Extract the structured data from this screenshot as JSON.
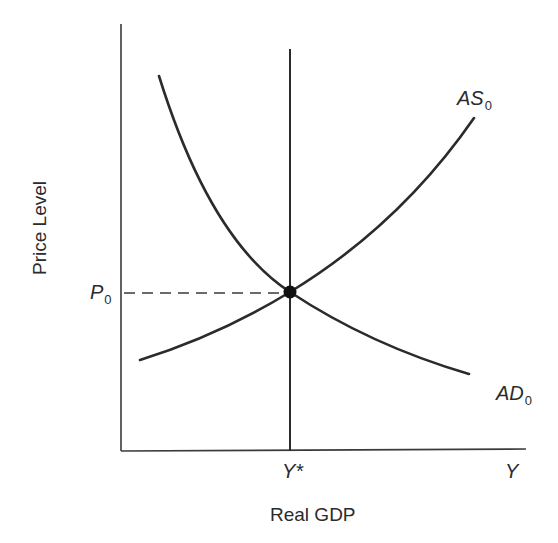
{
  "diagram": {
    "title": "",
    "axes": {
      "y_label": "Price Level",
      "x_label": "Real GDP",
      "x_end_label": "Y"
    },
    "markers": {
      "price_level": {
        "base": "P",
        "sub": "0"
      },
      "potential_output": "Y*"
    },
    "curves": {
      "aggregate_supply": {
        "base": "AS",
        "sub": "0",
        "shape": "upward-sloping convex"
      },
      "aggregate_demand": {
        "base": "AD",
        "sub": "0",
        "shape": "downward-sloping convex"
      },
      "long_run_supply": {
        "label": "Y*",
        "shape": "vertical line"
      }
    },
    "equilibrium": {
      "price": "P0",
      "output": "Y*"
    },
    "colors": {
      "line": "#2b2b2b",
      "background": "#ffffff"
    }
  }
}
